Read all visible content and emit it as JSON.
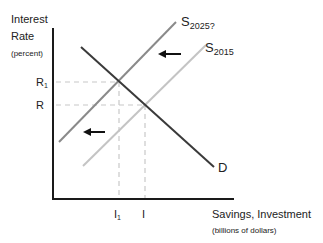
{
  "diagram": {
    "y_axis": {
      "title_line1": "Interest",
      "title_line2": "Rate",
      "unit": "(percent)",
      "ticks": [
        {
          "label": "R",
          "sub": "1"
        },
        {
          "label": "R",
          "sub": ""
        }
      ]
    },
    "x_axis": {
      "title": "Savings, Investment",
      "unit": "(billions of dollars)",
      "ticks": [
        {
          "label": "I",
          "sub": "1"
        },
        {
          "label": "I",
          "sub": ""
        }
      ]
    },
    "curves": {
      "supply_new": {
        "label": "S",
        "sub": "2025?",
        "color": "#8a8a8a"
      },
      "supply_old": {
        "label": "S",
        "sub": "2015",
        "color": "#c4c4c4"
      },
      "demand": {
        "label": "D",
        "sub": "",
        "color": "#3a3a3a"
      }
    },
    "arrows": [
      {
        "name": "shift-arrow-upper",
        "direction": "left"
      },
      {
        "name": "shift-arrow-lower",
        "direction": "left"
      }
    ],
    "colors": {
      "axis": "#1a1a1a",
      "guide": "#c8c8c8",
      "arrow": "#111111"
    }
  }
}
